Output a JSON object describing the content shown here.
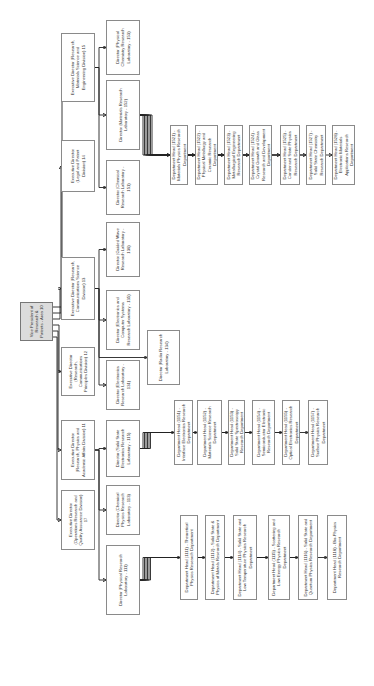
{
  "root": {
    "label": "Vice President of Research & Patents - Area 10"
  },
  "divisions": [
    {
      "id": "d17",
      "label": "Executive Director (Operations Research and Quality Assurance Division) 17"
    },
    {
      "id": "d11",
      "label": "Executive Director (Research, Physics and Academic Affairs Division) 11"
    },
    {
      "id": "d12",
      "label": "Executive Director (Research, Communications Principles Division) 12"
    },
    {
      "id": "d13",
      "label": "Executive Director (Research, Communications Science Division) 13"
    },
    {
      "id": "d14",
      "label": "Executive Director (Legal and Patent Division) 14"
    },
    {
      "id": "d15",
      "label": "Executive Director (Research, Materials Science and Engineering Division) 15"
    }
  ],
  "labs": [
    {
      "id": "l111",
      "label": "Director (Physical Research Laboratory - 111)"
    },
    {
      "id": "l113",
      "label": "Director (Chemical Physics Research Laboratory - 113)"
    },
    {
      "id": "l115",
      "label": "Director (Solid State Electronics Research Laboratory - 115)"
    },
    {
      "id": "l131",
      "label": "Director (Electronics Research Laboratory - 131)"
    },
    {
      "id": "l134",
      "label": "Director (Radio Research Laboratory - 134)"
    },
    {
      "id": "l135",
      "label": "Director (Electronics and Computer Systems Research Laboratory - 135)"
    },
    {
      "id": "l136",
      "label": "Director (Guided Wave Research Laboratory - 136)"
    },
    {
      "id": "l151",
      "label": "Director (Chemical Research Laboratory - 151)"
    },
    {
      "id": "l152",
      "label": "Director (Materials Research Laboratory - 152)"
    },
    {
      "id": "l153",
      "label": "Director (Physical Chemistry Research Laboratory - 153)"
    }
  ],
  "departments_111": [
    {
      "label": "Department Head (1111) - Theoretical Physics Research Department"
    },
    {
      "label": "Department Head (1112) - Solid State & Physics of Metals Research Department"
    },
    {
      "label": "Department Head (1114) - Solid State and Low Temperature Physics Research Department"
    },
    {
      "label": "Department Head (1115) - Scattering and Low Energy Physics Research Department"
    },
    {
      "label": "Department Head (1116) - Solid State and Quantum Physics Research Department"
    },
    {
      "label": "Department Head (1118) - Bio-Physics Research Department"
    }
  ],
  "departments_115": [
    {
      "label": "Department Head (1151) - Interface Electronics Research Department"
    },
    {
      "label": "Department Head (1152) - Materials Science Research Department"
    },
    {
      "label": "Department Head (1153) - Solid State Spectroscopy Research Department"
    },
    {
      "label": "Department Head (1154) - Semiconductor Electronic Research Department"
    },
    {
      "label": "Department Head (1155) - Optical Electronics Research Department"
    },
    {
      "label": "Department Head (1157) - Surface Physics Research Department"
    }
  ],
  "departments_152": [
    {
      "label": "Department Head (1521) - Materials Physics Research Department"
    },
    {
      "label": "Department Head (1522) - Physical Metallurgy and Ceramic Research Department"
    },
    {
      "label": "Department Head (1523) - Metallurgical Engineering Research Department"
    },
    {
      "label": "Department Head (1524) - Crystal Growth and Glass Research and Development Department"
    },
    {
      "label": "Department Head (1525) - Condensed State Physics Research Department"
    },
    {
      "label": "Department Head (1527) - Solid State Chemistry Research Department"
    },
    {
      "label": "Department Head (1528) - Electronic Materials Applications Research Department"
    }
  ]
}
